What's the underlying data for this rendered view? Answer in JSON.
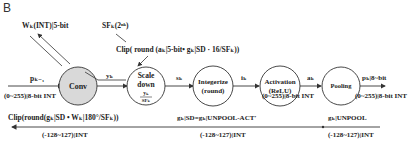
{
  "panel_label": "B",
  "inputs": {
    "weight": "Wₖ(INT)|5-bit",
    "scale_factor": "SFₖ(2ⁿᵏ)"
  },
  "forward_clip_formula": "Clip( round (aₖ|5-bit• gₖ|SD · 16/SFₖ))",
  "nodes": [
    {
      "id": "conv",
      "label": "Conv",
      "filled": true
    },
    {
      "id": "scale-down",
      "label": "Scale",
      "label2": "down",
      "frac_num": "yₖ",
      "frac_den": "SFₖ",
      "filled": false
    },
    {
      "id": "integerize",
      "label": "Integerize",
      "label2": "(round)",
      "filled": false
    },
    {
      "id": "activation",
      "label": "Activation",
      "label2": "(ReLU)",
      "filled": false
    },
    {
      "id": "pooling",
      "label": "Pooling",
      "filled": false
    }
  ],
  "forward_edges": {
    "input": "pₖ₋₁",
    "input_range": "(0~255)|8-bit INT",
    "conv_out": "yₖ",
    "scale_out": "sₖ",
    "integer_out": "iₖ",
    "act_out": "aₖ",
    "act_range": "(0~255)|8-bit INT",
    "output": "pₖ|8~bit",
    "output_range": "(0~255)|8-bit INT"
  },
  "backward": [
    {
      "formula": "Clip(round(gₖ|SD • Wₖ|180°/SFₖ))",
      "range": "(-128~127)|INT"
    },
    {
      "formula": "gₖ|SD=gₖ|UNPOOL-ACT′",
      "range": "(-128~127)|INT"
    },
    {
      "formula": "gₖ|UNPOOL",
      "range": "(-128~127)|INT"
    }
  ],
  "colors": {
    "conv_fill": "#d9d9d9",
    "stroke": "#333333"
  }
}
